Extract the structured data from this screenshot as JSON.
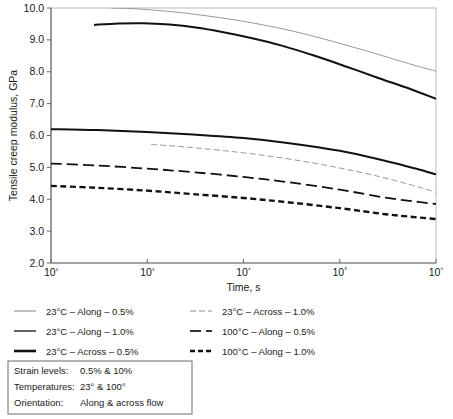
{
  "chart_data": {
    "type": "line",
    "title": "",
    "xlabel": "Time, s",
    "ylabel": "Tensile creep modulus, GPa",
    "xscale": "log",
    "xlim": [
      100,
      1000000
    ],
    "ylim": [
      2.0,
      10.0
    ],
    "xticks": [
      100,
      1000,
      10000,
      100000,
      1000000
    ],
    "xticklabels": [
      "10²",
      "10³",
      "10⁴",
      "10⁵",
      "10⁶"
    ],
    "yticks": [
      2.0,
      3.0,
      4.0,
      5.0,
      6.0,
      7.0,
      8.0,
      9.0,
      10.0
    ],
    "yticklabels": [
      "2.0",
      "3.0",
      "4.0",
      "5.0",
      "6.0",
      "7.0",
      "8.0",
      "9.0",
      "10.0"
    ],
    "grid": false,
    "legend_position": "below-axes",
    "series": [
      {
        "name": "23°C – Along – 0.5%",
        "style": "solid",
        "width": 0.9,
        "color": "#8c8c8c",
        "x": [
          420,
          700,
          1200,
          2200,
          4000,
          8000,
          16000,
          32000,
          70000,
          150000,
          320000,
          600000,
          1000000
        ],
        "y": [
          10.0,
          9.98,
          9.93,
          9.86,
          9.76,
          9.63,
          9.47,
          9.28,
          9.02,
          8.74,
          8.45,
          8.2,
          8.02
        ]
      },
      {
        "name": "23°C – Along – 1.0%",
        "style": "solid",
        "width": 2.0,
        "color": "#111111",
        "x": [
          280,
          500,
          900,
          1700,
          3200,
          6000,
          12000,
          25000,
          55000,
          120000,
          260000,
          550000,
          1000000
        ],
        "y": [
          9.47,
          9.51,
          9.52,
          9.48,
          9.39,
          9.25,
          9.06,
          8.82,
          8.5,
          8.15,
          7.79,
          7.45,
          7.15
        ]
      },
      {
        "name": "23°C – Across – 0.5%",
        "style": "solid",
        "width": 2.0,
        "color": "#111111",
        "x": [
          100,
          300,
          1000,
          3000,
          10000,
          30000,
          100000,
          300000,
          600000,
          1000000
        ],
        "y": [
          6.2,
          6.17,
          6.11,
          6.03,
          5.92,
          5.76,
          5.52,
          5.2,
          4.97,
          4.78
        ]
      },
      {
        "name": "23°C – Across – 1.0%",
        "style": "dashed-thin",
        "width": 0.9,
        "color": "#8c8c8c",
        "x": [
          1100,
          2500,
          6000,
          15000,
          40000,
          100000,
          250000,
          550000,
          1000000
        ],
        "y": [
          5.72,
          5.64,
          5.53,
          5.39,
          5.2,
          4.98,
          4.72,
          4.45,
          4.22
        ]
      },
      {
        "name": "100°C – Along – 0.5%",
        "style": "dashed",
        "width": 1.8,
        "color": "#111111",
        "x": [
          100,
          300,
          1000,
          3000,
          10000,
          30000,
          100000,
          300000,
          600000,
          1000000
        ],
        "y": [
          5.12,
          5.06,
          4.96,
          4.85,
          4.7,
          4.53,
          4.3,
          4.05,
          3.93,
          3.85
        ]
      },
      {
        "name": "100°C – Along – 1.0%",
        "style": "dotted-thick",
        "width": 2.4,
        "color": "#111111",
        "x": [
          100,
          300,
          1000,
          3000,
          10000,
          30000,
          100000,
          300000,
          600000,
          1000000
        ],
        "y": [
          4.42,
          4.36,
          4.27,
          4.16,
          4.04,
          3.9,
          3.72,
          3.53,
          3.44,
          3.38
        ]
      }
    ]
  },
  "legend": {
    "entries": [
      {
        "label": "23°C – Along – 0.5%",
        "style": "solid",
        "color": "#8c8c8c",
        "width": 1.1,
        "col": 0,
        "row": 0
      },
      {
        "label": "23°C – Along – 1.0%",
        "style": "solid",
        "color": "#4a4a4a",
        "width": 1.7,
        "col": 0,
        "row": 1
      },
      {
        "label": "23°C – Across – 0.5%",
        "style": "solid",
        "color": "#111111",
        "width": 2.6,
        "col": 0,
        "row": 2
      },
      {
        "label": "23°C – Across – 1.0%",
        "style": "dashed-thin",
        "color": "#8c8c8c",
        "width": 1.1,
        "col": 1,
        "row": 0
      },
      {
        "label": "100°C – Along – 0.5%",
        "style": "dashed",
        "color": "#333333",
        "width": 1.8,
        "col": 1,
        "row": 1
      },
      {
        "label": "100°C – Along – 1.0%",
        "style": "dotted-thick",
        "color": "#111111",
        "width": 2.6,
        "col": 1,
        "row": 2
      }
    ]
  },
  "info_box": {
    "rows": [
      {
        "label": "Strain levels:",
        "value": "0.5% & 10%"
      },
      {
        "label": "Temperatures:",
        "value": "23° & 100°"
      },
      {
        "label": "Orientation:",
        "value": "Along & across flow"
      }
    ]
  }
}
